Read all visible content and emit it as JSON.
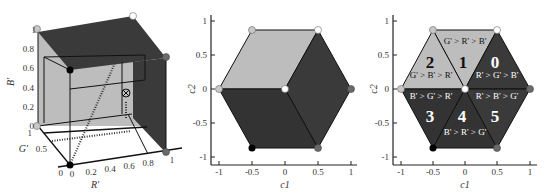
{
  "colors": {
    "light": "#bdbdbd",
    "dark": "#3a3a3a",
    "darker": "#2e2e2e",
    "axis": "#222222",
    "white": "#ffffff",
    "black": "#000000",
    "grey_dot": "#6a6a6a",
    "light_dot": "#c8c8c8"
  },
  "panel1": {
    "title": "RGB cube",
    "b_axis": {
      "label": "B'",
      "ticks": [
        "0",
        "0.2",
        "0.4",
        "0.6",
        "0.8",
        "1"
      ]
    },
    "g_axis": {
      "label": "G'",
      "ticks": [
        "0",
        "0.5",
        "1"
      ]
    },
    "r_axis": {
      "label": "R'",
      "ticks": [
        "0",
        "0.2",
        "0.4",
        "0.6",
        "0.8",
        "1"
      ]
    },
    "marker": "⊗"
  },
  "panel2": {
    "xlabel": "c1",
    "xlabel_sub": "1",
    "ylabel": "c2",
    "xticks": [
      "-1",
      "-0.5",
      "0",
      "0.5",
      "1"
    ],
    "yticks": [
      "1",
      "0.5",
      "0",
      "-0.5",
      "-1"
    ]
  },
  "panel3": {
    "xlabel": "c1",
    "ylabel": "c2",
    "xticks": [
      "-1",
      "-0.5",
      "0",
      "0.5",
      "1"
    ],
    "yticks": [
      "1",
      "0.5",
      "0",
      "-0.5",
      "-1"
    ],
    "sectors": [
      {
        "id": "0",
        "order": "R' > G' > B'"
      },
      {
        "id": "1",
        "order": "G' > R' > B'"
      },
      {
        "id": "2",
        "order": "G' > B' > R'"
      },
      {
        "id": "3",
        "order": "B' > G' > R'"
      },
      {
        "id": "4",
        "order": "B' > R' > G'"
      },
      {
        "id": "5",
        "order": "R' > B' > G'"
      }
    ]
  }
}
